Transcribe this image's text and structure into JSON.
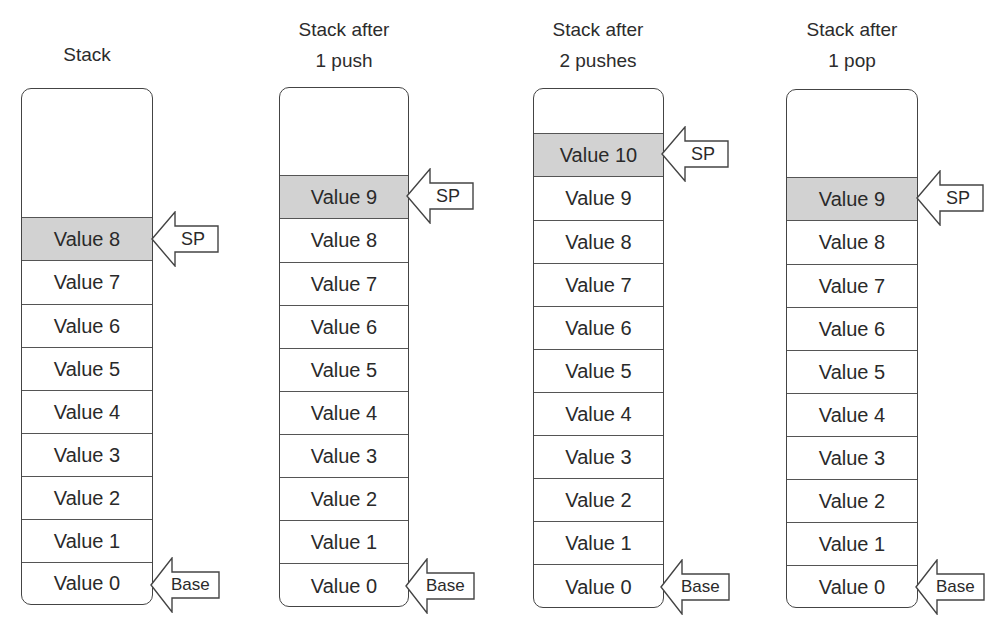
{
  "diagram": {
    "columns": [
      {
        "title_line1": "",
        "title_line2": "Stack",
        "values": [
          "Value 8",
          "Value 7",
          "Value 6",
          "Value 5",
          "Value 4",
          "Value 3",
          "Value 2",
          "Value 1",
          "Value 0"
        ],
        "top_of_stack": "Value 8",
        "sp_label": "SP",
        "base_label": "Base"
      },
      {
        "title_line1": "Stack after",
        "title_line2": "1 push",
        "values": [
          "Value 9",
          "Value 8",
          "Value 7",
          "Value 6",
          "Value 5",
          "Value 4",
          "Value 3",
          "Value 2",
          "Value 1",
          "Value 0"
        ],
        "top_of_stack": "Value 9",
        "sp_label": "SP",
        "base_label": "Base"
      },
      {
        "title_line1": "Stack after",
        "title_line2": "2 pushes",
        "values": [
          "Value 10",
          "Value 9",
          "Value 8",
          "Value 7",
          "Value 6",
          "Value 5",
          "Value 4",
          "Value 3",
          "Value 2",
          "Value 1",
          "Value 0"
        ],
        "top_of_stack": "Value 10",
        "sp_label": "SP",
        "base_label": "Base"
      },
      {
        "title_line1": "Stack after",
        "title_line2": "1 pop",
        "values": [
          "Value 9",
          "Value 8",
          "Value 7",
          "Value 6",
          "Value 5",
          "Value 4",
          "Value 3",
          "Value 2",
          "Value 1",
          "Value 0"
        ],
        "top_of_stack": "Value 9",
        "sp_label": "SP",
        "base_label": "Base"
      }
    ],
    "colors": {
      "top_slot_fill": "#d2d2d2",
      "outline": "#444444",
      "text": "#2a2a2a"
    }
  }
}
